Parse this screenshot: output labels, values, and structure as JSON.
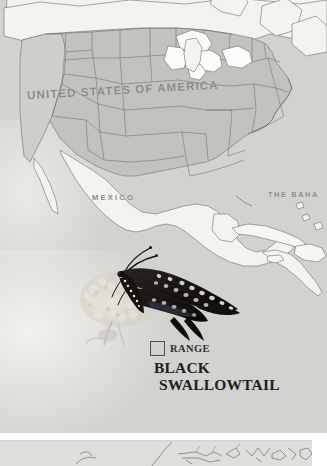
{
  "plate": {
    "type": "range-map",
    "region": "North America",
    "labels": [
      {
        "id": "usa",
        "text": "UNITED STATES OF AMERICA"
      },
      {
        "id": "mexico",
        "text": "MEXICO"
      },
      {
        "id": "bahamas",
        "text": "THE BAHA"
      }
    ],
    "colors": {
      "ocean": "#d2d2ce",
      "range_fill": "#c3c3bd",
      "non_range_fill": "#f3f3ef",
      "border": "#6f6f6b",
      "label": "#89898a"
    }
  },
  "legend": {
    "swatch_label": "RANGE",
    "swatch_icon": "square-swatch-icon"
  },
  "species": {
    "line1": "BLACK",
    "line2": "SWALLOWTAIL",
    "photo_alt": "black-swallowtail-butterfly-photo"
  },
  "next_page": {
    "note": "partial-map-outlines"
  }
}
